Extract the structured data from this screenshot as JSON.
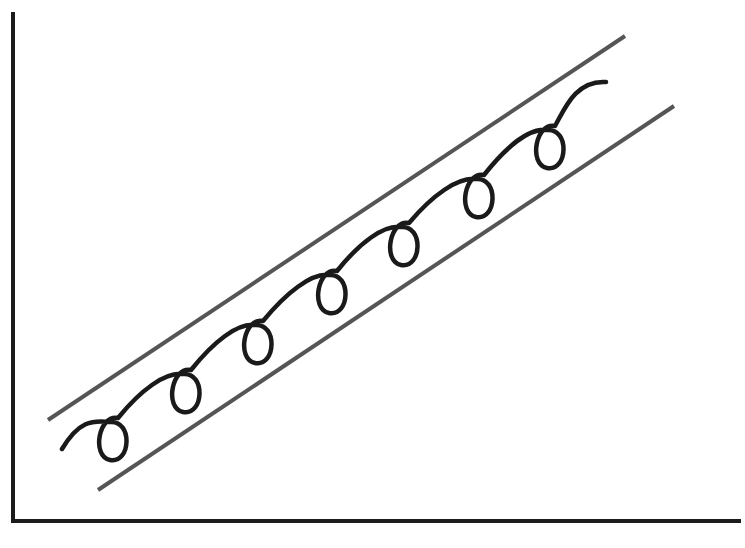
{
  "diagram": {
    "type": "schematic",
    "colors": {
      "background": "#ffffff",
      "axes": "#1c1c1c",
      "band_lines": "#555555",
      "spiral": "#1a1a1a"
    },
    "axes": {
      "x_label": "",
      "y_label": "",
      "y_axis": {
        "x": 13,
        "y_top": 12,
        "y_bottom": 521
      },
      "x_axis": {
        "y": 521,
        "x_left": 13,
        "x_right": 741
      }
    },
    "band": {
      "upper": {
        "x1": 48,
        "y1": 420,
        "x2": 625,
        "y2": 36
      },
      "lower": {
        "x1": 98,
        "y1": 490,
        "x2": 674,
        "y2": 106
      }
    },
    "spiral": {
      "start": [
        62,
        449
      ],
      "end": [
        606,
        82
      ],
      "loop_count": 7,
      "loop_centers": [
        [
          112,
          440
        ],
        [
          185,
          392
        ],
        [
          257,
          343
        ],
        [
          331,
          293
        ],
        [
          403,
          245
        ],
        [
          478,
          197
        ],
        [
          549,
          148
        ]
      ]
    }
  }
}
